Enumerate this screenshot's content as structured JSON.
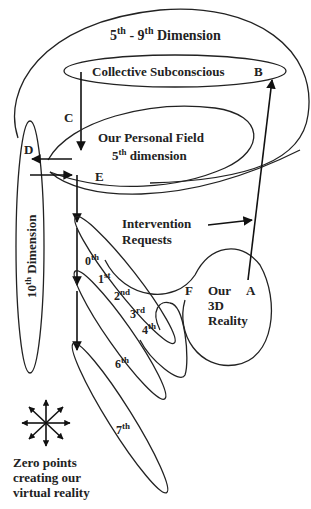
{
  "diagram": {
    "colors": {
      "ink": "#222222",
      "background": "#ffffff",
      "sparkle": "#9a9a9a"
    },
    "labels": {
      "outer_dimension": {
        "base": "5",
        "sup1": "th",
        "mid": " - 9",
        "sup2": "th",
        "rest": " Dimension"
      },
      "collective": "Collective Subconscious",
      "point_b": "B",
      "point_c": "C",
      "personal_field_line1": "Our Personal Field",
      "personal_field_line2": {
        "base": "5",
        "sup": "th",
        "rest": " dimension"
      },
      "point_d": "D",
      "point_e": "E",
      "tenth_dimension": {
        "base": "10",
        "sup": "th",
        "rest": " Dimension"
      },
      "intervention_line1": "Intervention",
      "intervention_line2": "Requests",
      "point_f": "F",
      "point_a": "A",
      "reality_line1": "Our",
      "reality_line2": "3D",
      "reality_line3": "Reality",
      "dim_0": {
        "base": "0",
        "sup": "th"
      },
      "dim_1": {
        "base": "1",
        "sup": "st"
      },
      "dim_2": {
        "base": "2",
        "sup": "nd"
      },
      "dim_3": {
        "base": "3",
        "sup": "rd"
      },
      "dim_4": {
        "base": "4",
        "sup": "th"
      },
      "dim_6": {
        "base": "6",
        "sup": "th"
      },
      "dim_7": {
        "base": "7",
        "sup": "th"
      },
      "legend_line1": "Zero points",
      "legend_line2": "creating our",
      "legend_line3": "virtual reality"
    },
    "icons": {
      "zero_point": "sparkle-icon",
      "legend": "eight-arrow-star-icon"
    }
  }
}
